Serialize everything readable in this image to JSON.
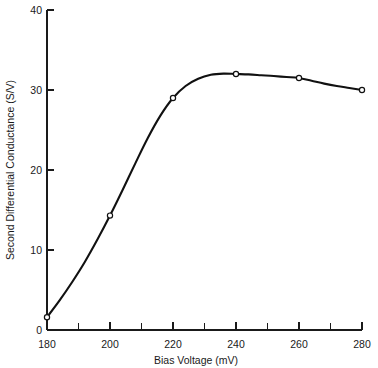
{
  "chart_data": {
    "type": "line",
    "title": "",
    "xlabel": "Bias Voltage (mV)",
    "ylabel": "Second Differential Conductance (S/V)",
    "xlim": [
      180,
      280
    ],
    "ylim": [
      0,
      40
    ],
    "xticks": [
      180,
      200,
      220,
      240,
      260,
      280
    ],
    "xtick_labels": [
      "180",
      "200",
      "220",
      "240",
      "260",
      "280"
    ],
    "xminor_ticks": [
      190,
      210,
      230,
      250,
      270
    ],
    "yticks": [
      0,
      10,
      20,
      30,
      40
    ],
    "ytick_labels": [
      "0",
      "10",
      "20",
      "30",
      "40"
    ],
    "grid": false,
    "legend": null,
    "marker": "open-circle",
    "line_color": "#111111",
    "marker_face_color": "#ffffff",
    "x": [
      180,
      200,
      220,
      240,
      260,
      280
    ],
    "values": [
      1.6,
      14.3,
      29.0,
      32.0,
      31.5,
      30.0
    ],
    "series": [
      {
        "name": "Second Differential Conductance",
        "x": [
          180,
          200,
          220,
          240,
          260,
          280
        ],
        "values": [
          1.6,
          14.3,
          29.0,
          32.0,
          31.5,
          30.0
        ]
      }
    ],
    "curve_dense": {
      "x": [
        180,
        184,
        188,
        192,
        196,
        200,
        204,
        208,
        212,
        216,
        220,
        224,
        228,
        232,
        236,
        240,
        244,
        248,
        252,
        256,
        260,
        264,
        268,
        272,
        276,
        280
      ],
      "y": [
        1.6,
        3.7,
        6.0,
        8.5,
        11.3,
        14.3,
        17.5,
        20.8,
        24.0,
        26.8,
        29.0,
        30.5,
        31.4,
        31.9,
        32.05,
        32.0,
        31.95,
        31.85,
        31.75,
        31.62,
        31.5,
        31.15,
        30.8,
        30.5,
        30.25,
        30.0
      ]
    }
  },
  "axis": {
    "y_title": "Second Differential Conductance (S/V)",
    "x_title": "Bias Voltage (mV)"
  }
}
